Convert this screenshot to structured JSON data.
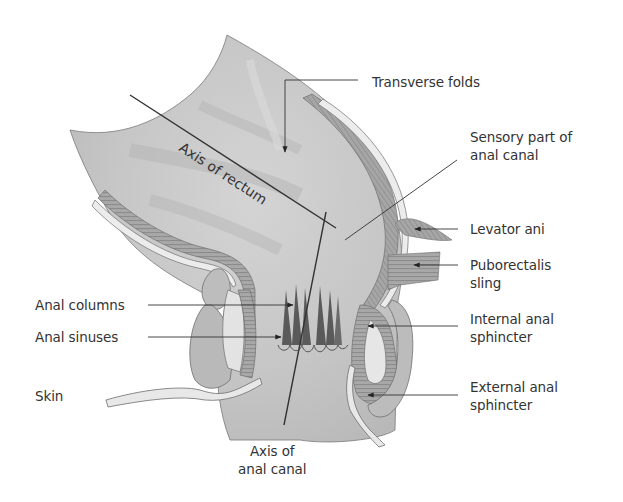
{
  "figure": {
    "type": "anatomical-diagram"
  },
  "labels": {
    "axis_rectum": "Axis of rectum",
    "transverse_folds": "Transverse folds",
    "sensory_part": [
      "Sensory part of",
      "anal canal"
    ],
    "levator_ani": "Levator ani",
    "puborectalis": [
      "Puborectalis",
      "sling"
    ],
    "internal_sphincter": [
      "Internal anal",
      "sphincter"
    ],
    "external_sphincter": [
      "External anal",
      "sphincter"
    ],
    "anal_columns": "Anal columns",
    "anal_sinuses": "Anal sinuses",
    "skin": "Skin",
    "axis_canal": [
      "Axis of",
      "anal canal"
    ]
  },
  "colors": {
    "tissue_fill": "#c8c8c8",
    "tissue_light": "#e2e2e2",
    "muscle_fill": "#a9a9a9",
    "outline": "#6e6e6e",
    "column_dark": "#555555",
    "leader_line": "#333333"
  }
}
